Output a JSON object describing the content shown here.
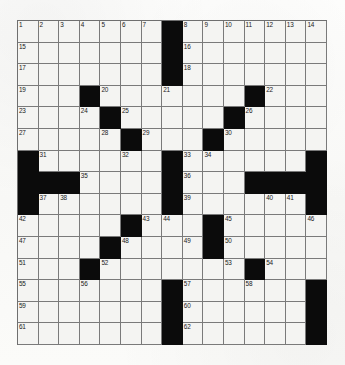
{
  "puzzle": {
    "type": "crossword-grid",
    "rows": 15,
    "cols": 15,
    "colors": {
      "block": "#0b0b0b",
      "open_cell": "#f4f4f2",
      "grid_line": "#7a7a7a",
      "number_text": "#1a1a1a",
      "paper": "#fdfdfb"
    },
    "blocks": [
      [
        0,
        7
      ],
      [
        1,
        7
      ],
      [
        2,
        7
      ],
      [
        3,
        3
      ],
      [
        3,
        11
      ],
      [
        4,
        4
      ],
      [
        4,
        10
      ],
      [
        5,
        5
      ],
      [
        5,
        9
      ],
      [
        6,
        0
      ],
      [
        6,
        7
      ],
      [
        6,
        14
      ],
      [
        7,
        0
      ],
      [
        7,
        1
      ],
      [
        7,
        2
      ],
      [
        7,
        7
      ],
      [
        7,
        11
      ],
      [
        7,
        12
      ],
      [
        7,
        13
      ],
      [
        7,
        14
      ],
      [
        8,
        0
      ],
      [
        8,
        7
      ],
      [
        8,
        14
      ],
      [
        9,
        5
      ],
      [
        9,
        9
      ],
      [
        10,
        4
      ],
      [
        10,
        9
      ],
      [
        11,
        3
      ],
      [
        11,
        11
      ],
      [
        12,
        7
      ],
      [
        12,
        14
      ],
      [
        13,
        7
      ],
      [
        13,
        14
      ],
      [
        14,
        7
      ],
      [
        14,
        14
      ]
    ],
    "numbers": [
      {
        "row": 0,
        "col": 0,
        "n": "1"
      },
      {
        "row": 0,
        "col": 1,
        "n": "2"
      },
      {
        "row": 0,
        "col": 2,
        "n": "3"
      },
      {
        "row": 0,
        "col": 3,
        "n": "4"
      },
      {
        "row": 0,
        "col": 4,
        "n": "5"
      },
      {
        "row": 0,
        "col": 5,
        "n": "6"
      },
      {
        "row": 0,
        "col": 6,
        "n": "7"
      },
      {
        "row": 0,
        "col": 8,
        "n": "8"
      },
      {
        "row": 0,
        "col": 9,
        "n": "9"
      },
      {
        "row": 0,
        "col": 10,
        "n": "10"
      },
      {
        "row": 0,
        "col": 11,
        "n": "11"
      },
      {
        "row": 0,
        "col": 12,
        "n": "12"
      },
      {
        "row": 0,
        "col": 13,
        "n": "13"
      },
      {
        "row": 0,
        "col": 14,
        "n": "14"
      },
      {
        "row": 1,
        "col": 0,
        "n": "15"
      },
      {
        "row": 1,
        "col": 8,
        "n": "16"
      },
      {
        "row": 2,
        "col": 0,
        "n": "17"
      },
      {
        "row": 2,
        "col": 8,
        "n": "18"
      },
      {
        "row": 3,
        "col": 0,
        "n": "19"
      },
      {
        "row": 3,
        "col": 4,
        "n": "20"
      },
      {
        "row": 3,
        "col": 7,
        "n": "21"
      },
      {
        "row": 3,
        "col": 12,
        "n": "22"
      },
      {
        "row": 4,
        "col": 0,
        "n": "23"
      },
      {
        "row": 4,
        "col": 3,
        "n": "24"
      },
      {
        "row": 4,
        "col": 5,
        "n": "25"
      },
      {
        "row": 4,
        "col": 11,
        "n": "26"
      },
      {
        "row": 5,
        "col": 0,
        "n": "27"
      },
      {
        "row": 5,
        "col": 4,
        "n": "28"
      },
      {
        "row": 5,
        "col": 6,
        "n": "29"
      },
      {
        "row": 5,
        "col": 10,
        "n": "30"
      },
      {
        "row": 6,
        "col": 1,
        "n": "31"
      },
      {
        "row": 6,
        "col": 5,
        "n": "32"
      },
      {
        "row": 6,
        "col": 8,
        "n": "33"
      },
      {
        "row": 6,
        "col": 9,
        "n": "34"
      },
      {
        "row": 7,
        "col": 3,
        "n": "35"
      },
      {
        "row": 7,
        "col": 8,
        "n": "36"
      },
      {
        "row": 8,
        "col": 1,
        "n": "37"
      },
      {
        "row": 8,
        "col": 2,
        "n": "38"
      },
      {
        "row": 8,
        "col": 8,
        "n": "39"
      },
      {
        "row": 8,
        "col": 12,
        "n": "40"
      },
      {
        "row": 8,
        "col": 13,
        "n": "41"
      },
      {
        "row": 9,
        "col": 0,
        "n": "42"
      },
      {
        "row": 9,
        "col": 6,
        "n": "43"
      },
      {
        "row": 9,
        "col": 7,
        "n": "44"
      },
      {
        "row": 9,
        "col": 10,
        "n": "45"
      },
      {
        "row": 9,
        "col": 14,
        "n": "46"
      },
      {
        "row": 10,
        "col": 0,
        "n": "47"
      },
      {
        "row": 10,
        "col": 5,
        "n": "48"
      },
      {
        "row": 10,
        "col": 8,
        "n": "49"
      },
      {
        "row": 10,
        "col": 10,
        "n": "50"
      },
      {
        "row": 11,
        "col": 0,
        "n": "51"
      },
      {
        "row": 11,
        "col": 4,
        "n": "52"
      },
      {
        "row": 11,
        "col": 10,
        "n": "53"
      },
      {
        "row": 11,
        "col": 12,
        "n": "54"
      },
      {
        "row": 12,
        "col": 0,
        "n": "55"
      },
      {
        "row": 12,
        "col": 3,
        "n": "56"
      },
      {
        "row": 12,
        "col": 8,
        "n": "57"
      },
      {
        "row": 12,
        "col": 11,
        "n": "58"
      },
      {
        "row": 13,
        "col": 0,
        "n": "59"
      },
      {
        "row": 13,
        "col": 8,
        "n": "60"
      },
      {
        "row": 14,
        "col": 0,
        "n": "61"
      },
      {
        "row": 14,
        "col": 8,
        "n": "62"
      }
    ]
  }
}
